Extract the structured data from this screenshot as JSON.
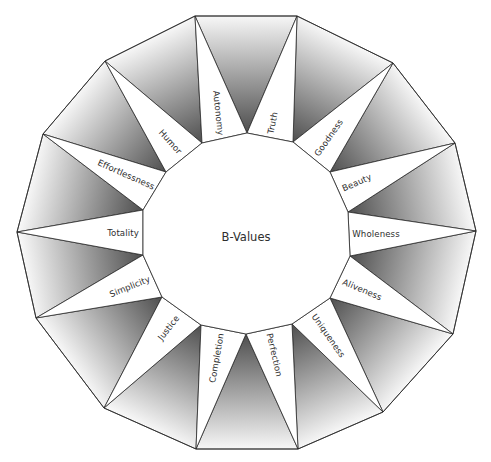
{
  "diagram": {
    "title": "B-Values",
    "title_pos": {
      "x": 246,
      "y": 237
    },
    "colors": {
      "stroke": "#2a2a2a",
      "gradient_dark": "#4e4e4e",
      "gradient_light": "#f7f7f7",
      "segment_fill": "#ffffff",
      "text": "#2e2e2e"
    },
    "outer_vertices": [
      [
        195,
        16
      ],
      [
        297,
        16
      ],
      [
        393,
        63
      ],
      [
        455,
        143
      ],
      [
        476,
        231
      ],
      [
        453,
        334
      ],
      [
        383,
        412
      ],
      [
        298,
        449
      ],
      [
        196,
        449
      ],
      [
        104,
        408
      ],
      [
        36,
        318
      ],
      [
        17,
        232
      ],
      [
        43,
        134
      ],
      [
        105,
        61
      ]
    ],
    "inner_vertices": [
      [
        247,
        133
      ],
      [
        293,
        142
      ],
      [
        330,
        172
      ],
      [
        348,
        212
      ],
      [
        350,
        256
      ],
      [
        330,
        298
      ],
      [
        292,
        324
      ],
      [
        246,
        334
      ],
      [
        201,
        325
      ],
      [
        162,
        297
      ],
      [
        143,
        255
      ],
      [
        143,
        210
      ],
      [
        166,
        172
      ],
      [
        202,
        143
      ]
    ],
    "values": [
      {
        "label": "Truth",
        "x": 273,
        "y": 123,
        "angle": -78
      },
      {
        "label": "Goodness",
        "x": 329,
        "y": 138,
        "angle": -55
      },
      {
        "label": "Beauty",
        "x": 357,
        "y": 183,
        "angle": -24
      },
      {
        "label": "Wholeness",
        "x": 376,
        "y": 234,
        "angle": 0
      },
      {
        "label": "Aliveness",
        "x": 362,
        "y": 290,
        "angle": 23
      },
      {
        "label": "Uniqueness",
        "x": 328,
        "y": 336,
        "angle": 55
      },
      {
        "label": "Perfection",
        "x": 274,
        "y": 355,
        "angle": 77
      },
      {
        "label": "Completion",
        "x": 217,
        "y": 358,
        "angle": -80
      },
      {
        "label": "Justice",
        "x": 169,
        "y": 328,
        "angle": -52
      },
      {
        "label": "Simplicity",
        "x": 130,
        "y": 287,
        "angle": -22
      },
      {
        "label": "Totality",
        "x": 123,
        "y": 233,
        "angle": 0
      },
      {
        "label": "Effortlessness",
        "x": 126,
        "y": 175,
        "angle": 24
      },
      {
        "label": "Humor",
        "x": 170,
        "y": 142,
        "angle": 48
      },
      {
        "label": "Autonomy",
        "x": 218,
        "y": 113,
        "angle": 84
      }
    ]
  }
}
